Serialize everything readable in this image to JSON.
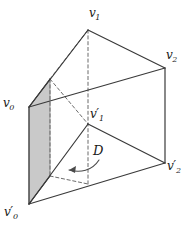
{
  "figure": {
    "kind": "triangular-prism-diagram",
    "width": 196,
    "height": 229,
    "background_color": "#ffffff",
    "stroke_color": "#3a3a3a",
    "dash_color": "#6b6b6b",
    "shaded_face_fill": "#c9c9c9",
    "shaded_face_stroke": "#8a8a8a",
    "labels": {
      "v0": {
        "base": "v",
        "sub": "0",
        "prime": "",
        "text": "v0"
      },
      "v1": {
        "base": "v",
        "sub": "1",
        "prime": "",
        "text": "v1"
      },
      "v2": {
        "base": "v",
        "sub": "2",
        "prime": "",
        "text": "v2"
      },
      "v0p": {
        "base": "v",
        "sub": "0",
        "prime": "′",
        "text": "v0'"
      },
      "v1p": {
        "base": "v",
        "sub": "1",
        "prime": "′",
        "text": "v1'"
      },
      "v2p": {
        "base": "v",
        "sub": "2",
        "prime": "′",
        "text": "v2'"
      },
      "D": {
        "base": "D",
        "text": "D"
      }
    },
    "vertices": {
      "v0": {
        "x": 29,
        "y": 107
      },
      "v1": {
        "x": 88,
        "y": 30
      },
      "v2": {
        "x": 165,
        "y": 68
      },
      "vb": {
        "x": 50,
        "y": 79
      },
      "v0p": {
        "x": 29,
        "y": 204
      },
      "v1p": {
        "x": 88,
        "y": 124
      },
      "v2p": {
        "x": 165,
        "y": 163
      },
      "vbp": {
        "x": 50,
        "y": 176
      },
      "vmid": {
        "x": 88,
        "y": 184
      }
    },
    "solid_edges": [
      {
        "name": "edge-v0-v1",
        "from": "v0",
        "to": "v1"
      },
      {
        "name": "edge-v1-v2",
        "from": "v1",
        "to": "v2"
      },
      {
        "name": "edge-v0-v2",
        "from": "v0",
        "to": "v2"
      },
      {
        "name": "edge-v0-v0p",
        "from": "v0",
        "to": "v0p"
      },
      {
        "name": "edge-v2-v2p",
        "from": "v2",
        "to": "v2p"
      },
      {
        "name": "edge-v0p-v2p",
        "from": "v0p",
        "to": "v2p"
      },
      {
        "name": "edge-v0p-v1p",
        "from": "v0p",
        "to": "v1p"
      },
      {
        "name": "edge-v1p-v2p",
        "from": "v1p",
        "to": "v2p"
      },
      {
        "name": "edge-v0-vb",
        "from": "v0",
        "to": "vb"
      },
      {
        "name": "edge-v0p-vbp",
        "from": "v0p",
        "to": "vbp"
      }
    ],
    "dashed_edges": [
      {
        "name": "hidden-edge-v1-vertical",
        "from": "v1",
        "to": "vmid"
      },
      {
        "name": "hidden-edge-vb-v1top",
        "from": "vb",
        "to": "v1"
      },
      {
        "name": "hidden-edge-vb-vbp",
        "from": "vb",
        "to": "vbp"
      },
      {
        "name": "hidden-edge-vbp-vmid",
        "from": "vbp",
        "to": "vmid"
      },
      {
        "name": "hidden-edge-vb-vmidtop",
        "from": "vb",
        "to": "v1p"
      }
    ],
    "shaded_face": {
      "name": "shaded-side-face",
      "points": "29,107 50,79 50,176 29,204"
    },
    "arrow": {
      "name": "direction-arrow",
      "path": "M 99,160 C 92,171 80,173 69,170",
      "head": "69,170 76,166 75,173"
    },
    "label_positions": {
      "v0": {
        "left": 3,
        "top": 97
      },
      "v1": {
        "left": 89,
        "top": 7
      },
      "v2": {
        "left": 166,
        "top": 49
      },
      "v0p": {
        "left": 4,
        "top": 206
      },
      "v1p": {
        "left": 90,
        "top": 108
      },
      "v2p": {
        "left": 167,
        "top": 160
      },
      "D": {
        "left": 93,
        "top": 144
      }
    }
  }
}
